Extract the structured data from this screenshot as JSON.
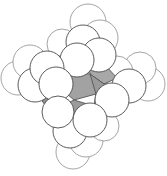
{
  "figure": {
    "background_color": "#ffffff",
    "outline_color": "#4a4a4a",
    "back_outline_color": "#8d8d8d",
    "caption": "",
    "label": ""
  },
  "chart_data": {
    "type": "scatter",
    "xlabel": "",
    "ylabel": "",
    "xlim": [
      0,
      167
    ],
    "ylim": [
      0,
      176
    ],
    "grid": false,
    "legend": "none",
    "annotations": [],
    "core": {
      "name": "carbon-core",
      "fill_color": "#9c9c9c",
      "fill_color_light": "#b4b4b4",
      "fill_color_dark": "#8a8a8a",
      "stroke_color": "#555555",
      "facets": [
        {
          "id": "core-top-right",
          "shade": "#a8a8a8",
          "points": "88,60 106,66 117,78 104,84 90,74"
        },
        {
          "id": "core-right",
          "shade": "#9a9a9a",
          "points": "90,74 104,84 119,86 116,98 96,94 86,84"
        },
        {
          "id": "core-center",
          "shade": "#a2a2a2",
          "points": "66,72 90,74 96,94 74,100 60,88"
        },
        {
          "id": "core-left",
          "shade": "#9d9d9d",
          "points": "46,64 66,72 60,88 44,84 38,72"
        },
        {
          "id": "core-bottom-left",
          "shade": "#8f8f8f",
          "points": "44,84 60,88 62,106 50,112 40,98"
        },
        {
          "id": "core-top-wedge",
          "shade": "#ababab",
          "points": "72,48 92,52 88,60 70,58"
        },
        {
          "id": "core-upper-left",
          "shade": "#a6a6a6",
          "points": "40,60 60,56 66,72 46,64"
        },
        {
          "id": "core-lower-right",
          "shade": "#969696",
          "points": "96,94 116,98 112,110 94,106"
        },
        {
          "id": "core-bottom",
          "shade": "#9b9b9b",
          "points": "62,106 74,100 94,106 84,118 66,116"
        }
      ]
    },
    "atoms": [
      {
        "id": "h-top-1",
        "cx": 88,
        "cy": 22,
        "r": 18,
        "layer": "back",
        "shade": "#ffffff"
      },
      {
        "id": "h-top-2",
        "cx": 100,
        "cy": 38,
        "r": 18,
        "layer": "back",
        "shade": "#ffffff"
      },
      {
        "id": "h-top-3",
        "cx": 83,
        "cy": 42,
        "r": 17,
        "layer": "front",
        "shade": "#ffffff"
      },
      {
        "id": "h-top-4",
        "cx": 99,
        "cy": 55,
        "r": 17,
        "layer": "front",
        "shade": "#ffffff"
      },
      {
        "id": "h-top-5",
        "cx": 77,
        "cy": 60,
        "r": 17,
        "layer": "front",
        "shade": "#ffffff"
      },
      {
        "id": "h-left-1",
        "cx": 18,
        "cy": 78,
        "r": 17,
        "layer": "back",
        "shade": "#ffffff"
      },
      {
        "id": "h-left-2",
        "cx": 30,
        "cy": 62,
        "r": 17,
        "layer": "back",
        "shade": "#ffffff"
      },
      {
        "id": "h-left-3",
        "cx": 35,
        "cy": 85,
        "r": 17,
        "layer": "front",
        "shade": "#ffffff"
      },
      {
        "id": "h-left-4",
        "cx": 47,
        "cy": 68,
        "r": 17,
        "layer": "front",
        "shade": "#ffffff"
      },
      {
        "id": "h-left-5",
        "cx": 56,
        "cy": 84,
        "r": 17,
        "layer": "front",
        "shade": "#ffffff"
      },
      {
        "id": "h-right-1",
        "cx": 148,
        "cy": 84,
        "r": 17,
        "layer": "back",
        "shade": "#ffffff"
      },
      {
        "id": "h-right-2",
        "cx": 140,
        "cy": 68,
        "r": 16,
        "layer": "back",
        "shade": "#ffffff"
      },
      {
        "id": "h-right-3",
        "cx": 129,
        "cy": 86,
        "r": 17,
        "layer": "front",
        "shade": "#ffffff"
      },
      {
        "id": "h-right-4",
        "cx": 117,
        "cy": 72,
        "r": 16,
        "layer": "back",
        "shade": "#ffffff"
      },
      {
        "id": "h-right-5",
        "cx": 112,
        "cy": 100,
        "r": 17,
        "layer": "front",
        "shade": "#ffffff"
      },
      {
        "id": "h-bottom-1",
        "cx": 73,
        "cy": 152,
        "r": 17,
        "layer": "back",
        "shade": "#ffffff"
      },
      {
        "id": "h-bottom-2",
        "cx": 86,
        "cy": 140,
        "r": 17,
        "layer": "back",
        "shade": "#ffffff"
      },
      {
        "id": "h-bottom-3",
        "cx": 70,
        "cy": 131,
        "r": 17,
        "layer": "front",
        "shade": "#ffffff"
      },
      {
        "id": "h-bottom-4",
        "cx": 90,
        "cy": 120,
        "r": 17,
        "layer": "front",
        "shade": "#ffffff"
      },
      {
        "id": "h-bottom-5",
        "cx": 58,
        "cy": 112,
        "r": 16,
        "layer": "front",
        "shade": "#ffffff"
      },
      {
        "id": "h-inner-upper",
        "cx": 62,
        "cy": 44,
        "r": 15,
        "layer": "back",
        "shade": "#ffffff"
      },
      {
        "id": "h-inner-lower",
        "cx": 104,
        "cy": 126,
        "r": 15,
        "layer": "back",
        "shade": "#ffffff"
      }
    ]
  }
}
